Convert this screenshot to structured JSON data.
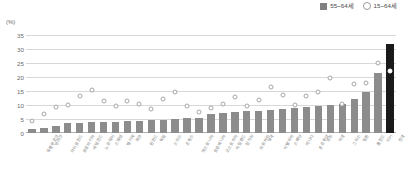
{
  "legend": {
    "items": [
      {
        "label": "55~64세",
        "type": "bar-swatch",
        "color": "#808080"
      },
      {
        "label": "15~64세",
        "type": "circle-marker",
        "color": "#9a9a9a"
      }
    ]
  },
  "axis": {
    "unit": "(%)",
    "yticks": [
      "35",
      "30",
      "25",
      "20",
      "15",
      "10",
      "5",
      "0"
    ]
  },
  "colors": {
    "bar": "#8c8c8c",
    "bar_highlight": "#1a1a1a",
    "marker_stroke": "#9a9a9a",
    "grid": "#d8d8d8",
    "text": "#6b6b6b"
  },
  "chart_data": {
    "type": "bar",
    "title": "",
    "subtitle": "",
    "xlabel": "",
    "ylabel": "(%)",
    "ylim": [
      0,
      35
    ],
    "grid": true,
    "legend_position": "top-right",
    "highlight_index": 30,
    "categories": [
      "룩셈부르크",
      "덴마크",
      "아이슬란드",
      "슬로바키아",
      "네덜란드",
      "노르웨이",
      "스웨덴",
      "벨기에",
      "체코",
      "핀란드",
      "독일",
      "스위스",
      "프랑스",
      "에스토니아",
      "슬로베니아",
      "오스트리아",
      "아일랜드",
      "헝가리",
      "라트비아",
      "영국",
      "이탈리아",
      "스페인",
      "캐나다",
      "포르투갈",
      "호주",
      "미국",
      "그리스",
      "일본",
      "폴란드",
      "터키",
      "한국"
    ],
    "series": [
      {
        "name": "55~64세",
        "type": "bar",
        "values": [
          1.5,
          1.7,
          2.6,
          3.4,
          3.6,
          3.8,
          4.0,
          4.1,
          4.3,
          4.4,
          4.6,
          4.8,
          5.0,
          5.2,
          5.4,
          6.9,
          7.2,
          7.5,
          7.8,
          8.0,
          8.2,
          8.5,
          9.0,
          9.3,
          9.6,
          10.0,
          10.4,
          12.2,
          14.6,
          21.3,
          31.7
        ]
      },
      {
        "name": "15~64세",
        "type": "scatter",
        "values": [
          4.2,
          6.8,
          9.3,
          10.0,
          13.2,
          15.4,
          11.5,
          9.8,
          11.3,
          10.2,
          8.5,
          12.0,
          14.8,
          9.5,
          7.5,
          9.0,
          10.5,
          13.0,
          9.6,
          11.9,
          16.5,
          13.5,
          10.1,
          13.2,
          14.5,
          19.8,
          10.3,
          17.5,
          18.0,
          25.0,
          22.2
        ]
      }
    ]
  }
}
